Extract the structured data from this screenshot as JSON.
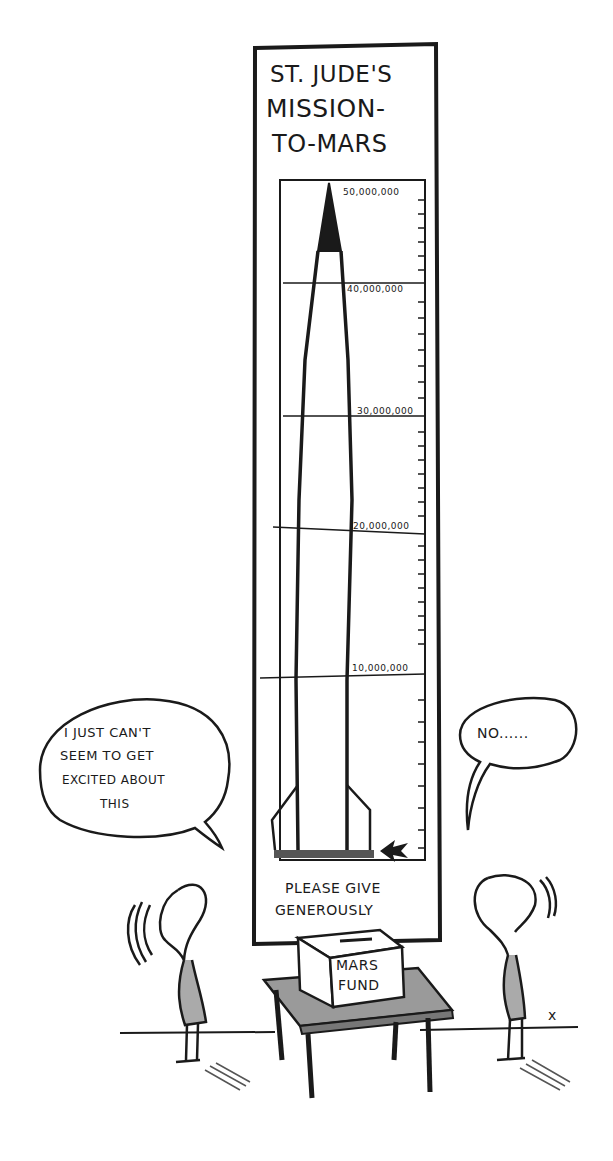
{
  "sign": {
    "title_lines": [
      "ST. JUDE'S",
      "MISSION-",
      "TO-MARS"
    ],
    "footer_lines": [
      "PLEASE GIVE",
      "GENEROUSLY"
    ]
  },
  "thermometer": {
    "tick_labels": [
      "50,000,000",
      "40,000,000",
      "30,000,000",
      "20,000,000",
      "10,000,000"
    ],
    "current_level_marker": "arrow-at-base",
    "current_amount_fraction": 0.0
  },
  "donation_box": {
    "label_lines": [
      "MARS",
      "FUND"
    ]
  },
  "speech": {
    "left": [
      "I JUST CAN'T",
      "SEEM TO GET",
      "EXCITED ABOUT",
      "THIS"
    ],
    "right": "NO......"
  },
  "signature": "x"
}
